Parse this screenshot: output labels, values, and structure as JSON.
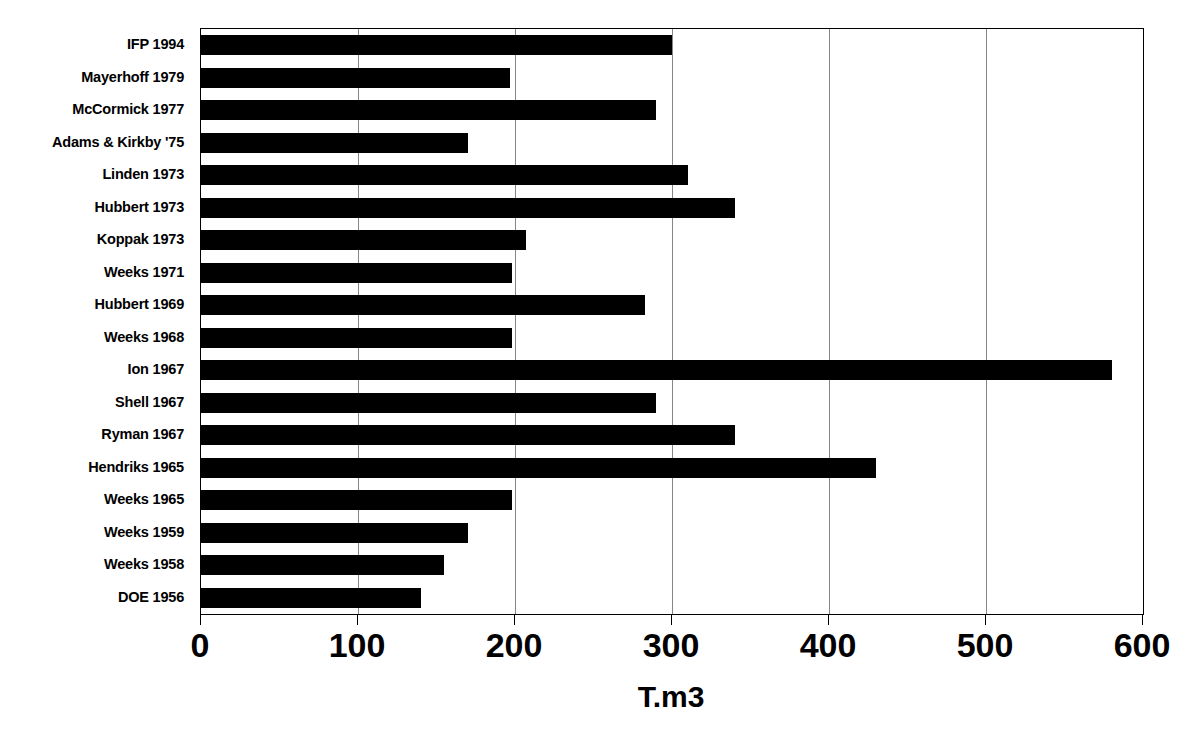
{
  "chart_data": {
    "type": "bar",
    "orientation": "horizontal",
    "title": "",
    "xlabel": "T.m3",
    "ylabel": "",
    "xlim": [
      0,
      600
    ],
    "xticks": [
      0,
      100,
      200,
      300,
      400,
      500,
      600
    ],
    "xtick_labels": [
      "0",
      "100",
      "200",
      "300",
      "400",
      "500",
      "600"
    ],
    "grid": true,
    "legend": null,
    "bar_color": "#000000",
    "categories": [
      "IFP 1994",
      "Mayerhoff 1979",
      "McCormick 1977",
      "Adams & Kirkby '75",
      "Linden 1973",
      "Hubbert 1973",
      "Koppak 1973",
      "Weeks 1971",
      "Hubbert 1969",
      "Weeks 1968",
      "Ion 1967",
      "Shell 1967",
      "Ryman 1967",
      "Hendriks 1965",
      "Weeks 1965",
      "Weeks 1959",
      "Weeks 1958",
      "DOE 1956"
    ],
    "values": [
      300,
      197,
      290,
      170,
      310,
      340,
      207,
      198,
      283,
      198,
      580,
      290,
      340,
      430,
      198,
      170,
      155,
      140
    ]
  }
}
